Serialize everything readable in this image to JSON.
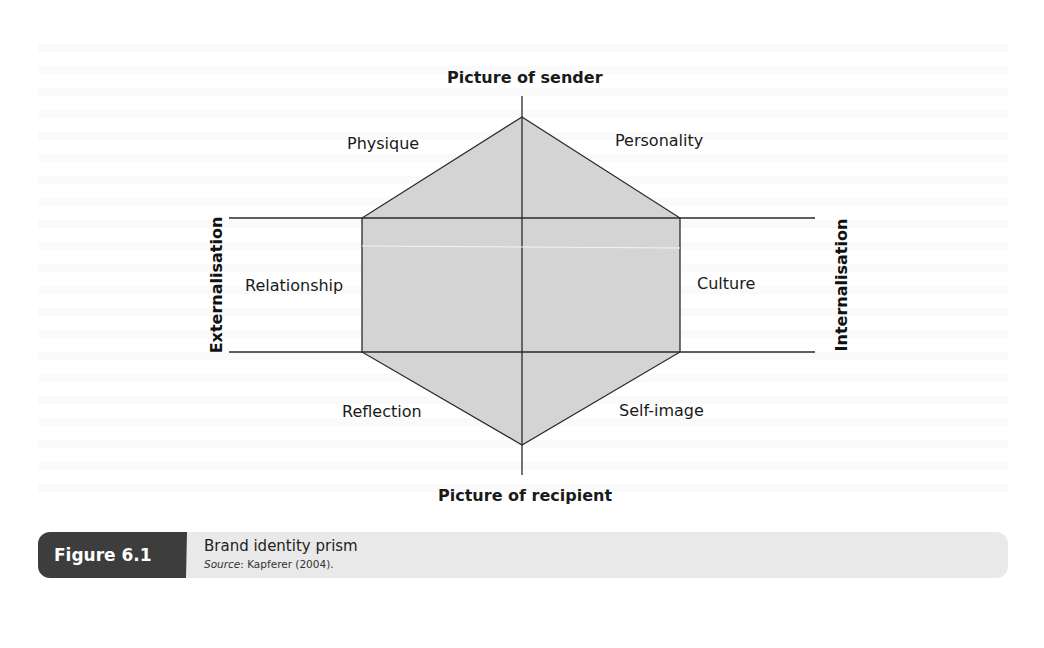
{
  "figure": {
    "number_label": "Figure 6.1",
    "title": "Brand identity prism",
    "source_prefix": "Source",
    "source_text": ": Kapferer (2004)."
  },
  "diagram": {
    "type": "brand-identity-prism",
    "axis_top": "Picture of sender",
    "axis_bottom": "Picture of recipient",
    "axis_left": "Externalisation",
    "axis_right": "Internalisation",
    "facets": {
      "upper_left": "Physique",
      "upper_right": "Personality",
      "middle_left": "Relationship",
      "middle_right": "Culture",
      "lower_left": "Reflection",
      "lower_right": "Self-image"
    },
    "colors": {
      "hexagon_fill": "#d4d4d4",
      "line": "#2a2a2a",
      "caption_tab": "#3d3d3d",
      "caption_bar": "#e9e9e9"
    }
  }
}
